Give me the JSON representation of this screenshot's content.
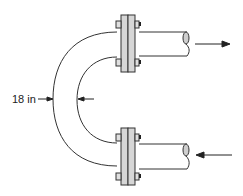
{
  "diagram": {
    "type": "U-bend pipe with flanged connections",
    "dimension": {
      "label": "18 in",
      "meaning": "pipe diameter at bend"
    },
    "flow": {
      "outlet": {
        "direction": "right",
        "pipe": "top"
      },
      "inlet": {
        "direction": "left",
        "pipe": "bottom"
      }
    },
    "colors": {
      "line": "#333333",
      "flange_fill": "#d6d6d6",
      "bolt_fill": "#e0e0e0",
      "nut_dark": "#222222",
      "pipe_end_fill": "#cfcfcf"
    }
  }
}
